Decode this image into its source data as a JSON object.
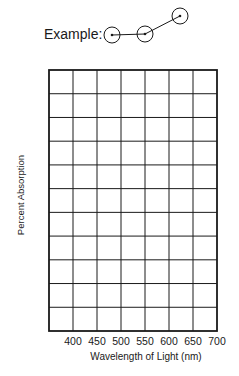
{
  "example": {
    "label": "Example:",
    "points": [
      {
        "cx": 112,
        "cy": 35
      },
      {
        "cx": 145,
        "cy": 34
      },
      {
        "cx": 180,
        "cy": 16
      }
    ],
    "circle_radius": 8
  },
  "chart_data": {
    "type": "line",
    "title": "",
    "xlabel": "Wavelength of Light (nm)",
    "ylabel": "Percent Absorption",
    "x_ticks": [
      "400",
      "450",
      "500",
      "550",
      "600",
      "650",
      "700"
    ],
    "xlim": [
      375,
      700
    ],
    "grid": true,
    "grid_columns": 7,
    "grid_rows": 11,
    "series": [],
    "note": "Blank graph grid for plotting; example shows circled points connected by lines"
  },
  "axis": {
    "xlabel": "Wavelength of Light (nm)",
    "ylabel": "Percent Absorption",
    "ticks": [
      "400",
      "450",
      "500",
      "550",
      "600",
      "650",
      "700"
    ]
  },
  "colors": {
    "ink": "#1a1a1a",
    "background": "#ffffff"
  }
}
